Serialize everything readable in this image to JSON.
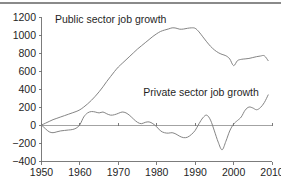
{
  "figure": {
    "background_color": "#ffffff",
    "line_color": "#7d7d7d",
    "axis_color": "#6e6e6e",
    "rule_color": "#8a8a8a"
  },
  "caption": {
    "text": "",
    "note": "clipped"
  },
  "chart_data": {
    "type": "line",
    "title": "",
    "xlabel": "",
    "ylabel": "",
    "xlim": [
      1950,
      2010
    ],
    "ylim": [
      -400,
      1200
    ],
    "grid": false,
    "legend_position": "inline-annotation",
    "yticks": [
      -400,
      -200,
      0,
      200,
      400,
      600,
      800,
      1000,
      1200
    ],
    "ytick_labels": [
      "−400",
      "−200",
      "0",
      "200",
      "400",
      "600",
      "800",
      "1000",
      "1200"
    ],
    "xticks": [
      1950,
      1960,
      1970,
      1980,
      1990,
      2000,
      2010
    ],
    "xtick_labels": [
      "1950",
      "1960",
      "1970",
      "1980",
      "1990",
      "2000",
      "2010"
    ],
    "annotations": [
      {
        "text": "Public sector job growth",
        "x": 1953.5,
        "y": 1135,
        "align": "start"
      },
      {
        "text": "Private sector job growth",
        "x": 1976.5,
        "y": 330,
        "align": "start"
      }
    ],
    "series": [
      {
        "name": "Public sector job growth",
        "color": "#7d7d7d",
        "x": [
          1950,
          1951,
          1952,
          1953,
          1954,
          1955,
          1956,
          1957,
          1958,
          1959,
          1960,
          1961,
          1962,
          1963,
          1964,
          1965,
          1966,
          1967,
          1968,
          1969,
          1970,
          1971,
          1972,
          1973,
          1974,
          1975,
          1976,
          1977,
          1978,
          1979,
          1980,
          1981,
          1982,
          1983,
          1984,
          1985,
          1986,
          1987,
          1988,
          1989,
          1990,
          1991,
          1992,
          1993,
          1994,
          1995,
          1996,
          1997,
          1998,
          1999,
          2000,
          2001,
          2002,
          2003,
          2004,
          2005,
          2006,
          2007,
          2008,
          2009
        ],
        "values": [
          5,
          25,
          45,
          65,
          80,
          95,
          110,
          125,
          140,
          155,
          175,
          205,
          240,
          280,
          325,
          375,
          430,
          490,
          545,
          600,
          650,
          690,
          730,
          770,
          810,
          850,
          885,
          920,
          955,
          990,
          1020,
          1045,
          1060,
          1072,
          1085,
          1082,
          1070,
          1072,
          1080,
          1085,
          1080,
          1040,
          985,
          930,
          880,
          840,
          810,
          790,
          775,
          740,
          665,
          720,
          735,
          740,
          745,
          755,
          765,
          772,
          775,
          720
        ]
      },
      {
        "name": "Private sector job growth",
        "color": "#7d7d7d",
        "x": [
          1950,
          1951,
          1952,
          1953,
          1954,
          1955,
          1956,
          1957,
          1958,
          1959,
          1960,
          1961,
          1962,
          1963,
          1964,
          1965,
          1966,
          1967,
          1968,
          1969,
          1970,
          1971,
          1972,
          1973,
          1974,
          1975,
          1976,
          1977,
          1978,
          1979,
          1980,
          1981,
          1982,
          1983,
          1984,
          1985,
          1986,
          1987,
          1988,
          1989,
          1990,
          1991,
          1992,
          1993,
          1994,
          1995,
          1996,
          1997,
          1998,
          1999,
          2000,
          2001,
          2002,
          2003,
          2004,
          2005,
          2006,
          2007,
          2008,
          2009
        ],
        "values": [
          5,
          -35,
          -70,
          -80,
          -70,
          -60,
          -55,
          -50,
          -45,
          -30,
          10,
          95,
          140,
          155,
          150,
          140,
          150,
          130,
          115,
          120,
          135,
          150,
          140,
          110,
          70,
          35,
          20,
          35,
          40,
          20,
          -15,
          -60,
          -80,
          -85,
          -80,
          -95,
          -120,
          -135,
          -130,
          -100,
          -55,
          20,
          85,
          115,
          60,
          -60,
          -185,
          -270,
          -175,
          -60,
          15,
          55,
          95,
          170,
          205,
          195,
          175,
          200,
          255,
          340
        ]
      }
    ]
  }
}
